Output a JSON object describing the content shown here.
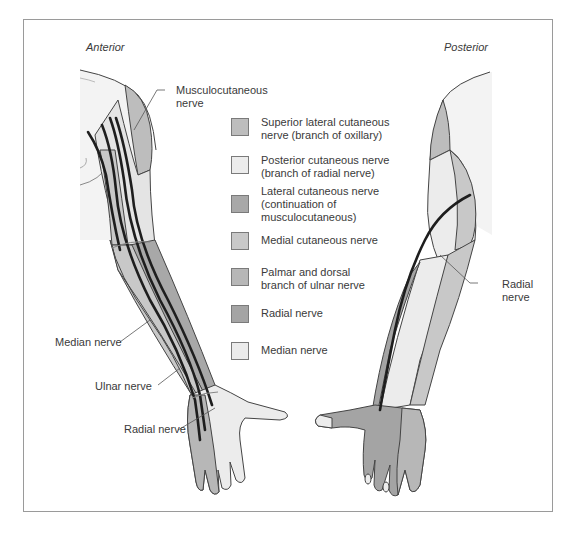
{
  "figure": {
    "views": {
      "anterior": "Anterior",
      "posterior": "Posterior"
    },
    "callouts": {
      "musculocutaneous": "Musculocutaneous\nnerve",
      "median": "Median nerve",
      "ulnar": "Ulnar nerve",
      "radial_anterior": "Radial nerve",
      "radial_posterior": "Radial\nnerve"
    },
    "legend": [
      {
        "label": "Superior lateral cutaneous\nnerve (branch of oxillary)",
        "color": "#bdbdbd"
      },
      {
        "label": "Posterior cutaneous nerve\n(branch of radial nerve)",
        "color": "#ececec"
      },
      {
        "label": "Lateral cutaneous nerve\n(continuation of\nmusculocutaneous)",
        "color": "#a8a8a8"
      },
      {
        "label": "Medial cutaneous nerve",
        "color": "#c8c8c8"
      },
      {
        "label": "Palmar and dorsal\nbranch of ulnar nerve",
        "color": "#b7b7b7"
      },
      {
        "label": "Radial nerve",
        "color": "#a4a4a4"
      },
      {
        "label": "Median nerve",
        "color": "#ebebeb"
      }
    ]
  }
}
